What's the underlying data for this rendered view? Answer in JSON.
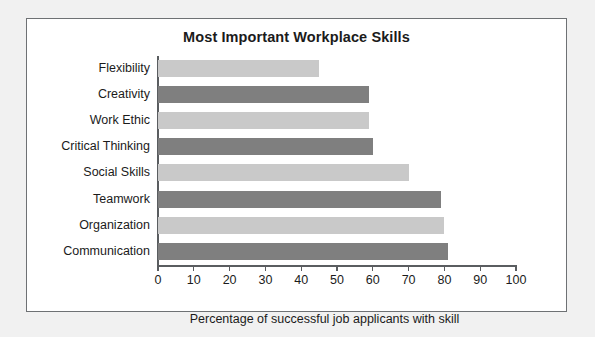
{
  "chart_data": {
    "type": "bar",
    "orientation": "horizontal",
    "title": "Most Important Workplace Skills",
    "xlabel": "Percentage of successful job applicants with skill",
    "ylabel": "",
    "xlim": [
      0,
      100
    ],
    "xticks": [
      "0",
      "10",
      "20",
      "30",
      "40",
      "50",
      "60",
      "70",
      "80",
      "90",
      "100"
    ],
    "grid": false,
    "legend": null,
    "categories": [
      "Flexibility",
      "Creativity",
      "Work Ethic",
      "Critical Thinking",
      "Social Skills",
      "Teamwork",
      "Organization",
      "Communication"
    ],
    "values": [
      45,
      59,
      59,
      60,
      70,
      79,
      80,
      81
    ],
    "bar_colors": [
      "light",
      "dark",
      "light",
      "dark",
      "light",
      "dark",
      "light",
      "dark"
    ]
  },
  "colors": {
    "bar_light": "#c9c9c9",
    "bar_dark": "#7f7f7f",
    "axis": "#5a5d60",
    "text": "#1b1b1b",
    "frame_border": "#6e7174",
    "plate": "#ffffff",
    "page_background": "#f1f1f1"
  }
}
